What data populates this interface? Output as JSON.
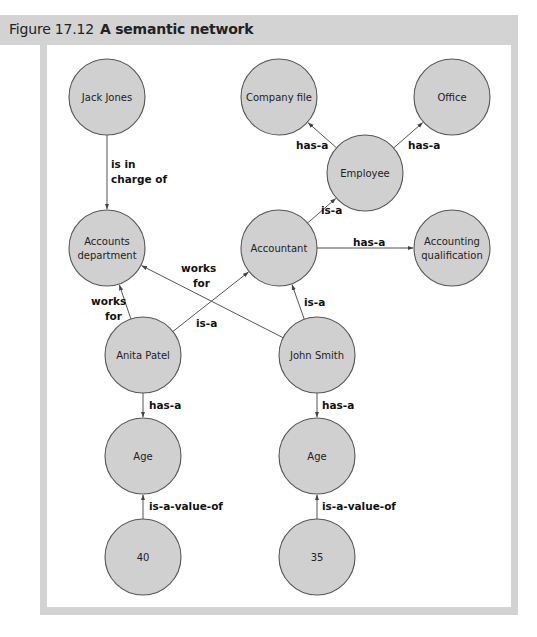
{
  "figure": {
    "number": "Figure 17.12",
    "title": "A semantic network"
  },
  "colors": {
    "frame": "#d3d3d3",
    "node_fill": "#d0d0d0",
    "node_stroke": "#555555",
    "edge": "#555555"
  },
  "nodes": [
    {
      "id": "jack_jones",
      "label": [
        "Jack Jones"
      ],
      "cx": 107,
      "cy": 97
    },
    {
      "id": "company_file",
      "label": [
        "Company file"
      ],
      "cx": 279,
      "cy": 97
    },
    {
      "id": "office",
      "label": [
        "Office"
      ],
      "cx": 452,
      "cy": 97
    },
    {
      "id": "employee",
      "label": [
        "Employee"
      ],
      "cx": 365,
      "cy": 173
    },
    {
      "id": "accounts_department",
      "label": [
        "Accounts",
        "department"
      ],
      "cx": 107,
      "cy": 248
    },
    {
      "id": "accountant",
      "label": [
        "Accountant"
      ],
      "cx": 279,
      "cy": 248
    },
    {
      "id": "accounting_qualification",
      "label": [
        "Accounting",
        "qualification"
      ],
      "cx": 452,
      "cy": 248
    },
    {
      "id": "anita_patel",
      "label": [
        "Anita Patel"
      ],
      "cx": 143,
      "cy": 355
    },
    {
      "id": "john_smith",
      "label": [
        "John Smith"
      ],
      "cx": 317,
      "cy": 355
    },
    {
      "id": "age_1",
      "label": [
        "Age"
      ],
      "cx": 143,
      "cy": 456
    },
    {
      "id": "age_2",
      "label": [
        "Age"
      ],
      "cx": 317,
      "cy": 456
    },
    {
      "id": "value_40",
      "label": [
        "40"
      ],
      "cx": 143,
      "cy": 557
    },
    {
      "id": "value_35",
      "label": [
        "35"
      ],
      "cx": 317,
      "cy": 557
    }
  ],
  "edges": [
    {
      "from": "jack_jones",
      "to": "accounts_department",
      "label": [
        "is in",
        "charge of"
      ],
      "lx": 111,
      "ly": 168
    },
    {
      "from": "employee",
      "to": "company_file",
      "label": [
        "has-a"
      ],
      "lx": 296,
      "ly": 149
    },
    {
      "from": "employee",
      "to": "office",
      "label": [
        "has-a"
      ],
      "lx": 408,
      "ly": 149
    },
    {
      "from": "accountant",
      "to": "employee",
      "label": [
        "is-a"
      ],
      "lx": 321,
      "ly": 214
    },
    {
      "from": "accountant",
      "to": "accounting_qualification",
      "label": [
        "has-a"
      ],
      "lx": 353,
      "ly": 246
    },
    {
      "from": "john_smith",
      "to": "accounts_department",
      "label": [
        "works",
        "for"
      ],
      "lx": 181,
      "ly": 272,
      "lx2": 193
    },
    {
      "from": "anita_patel",
      "to": "accounts_department",
      "label": [
        "works",
        "for"
      ],
      "lx": 91,
      "ly": 305,
      "lx2": 105
    },
    {
      "from": "anita_patel",
      "to": "accountant",
      "label": [
        "is-a"
      ],
      "lx": 196,
      "ly": 327
    },
    {
      "from": "john_smith",
      "to": "accountant",
      "label": [
        "is-a"
      ],
      "lx": 304,
      "ly": 306
    },
    {
      "from": "anita_patel",
      "to": "age_1",
      "label": [
        "has-a"
      ],
      "lx": 149,
      "ly": 409
    },
    {
      "from": "john_smith",
      "to": "age_2",
      "label": [
        "has-a"
      ],
      "lx": 322,
      "ly": 409
    },
    {
      "from": "value_40",
      "to": "age_1",
      "label": [
        "is-a-value-of"
      ],
      "lx": 149,
      "ly": 510
    },
    {
      "from": "value_35",
      "to": "age_2",
      "label": [
        "is-a-value-of"
      ],
      "lx": 322,
      "ly": 510
    }
  ]
}
